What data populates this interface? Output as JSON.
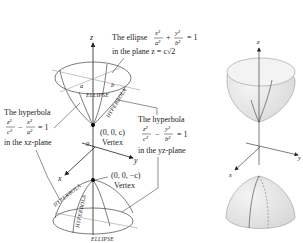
{
  "left_diagram": {
    "axes": {
      "z": "z",
      "y": "y",
      "x": "x",
      "origin": "0"
    },
    "top_ellipse_label": {
      "line1_prefix": "The ellipse",
      "frac1_num": "x²",
      "frac1_den": "a²",
      "plus": "+",
      "frac2_num": "y²",
      "frac2_den": "b²",
      "equals": "= 1",
      "line2": "in the plane z = c√2"
    },
    "semi_axes": {
      "a": "a",
      "b": "b"
    },
    "curve_labels": {
      "ellipse_top": "ELLIPSE",
      "hyperbola_top": "HYPERBOLA",
      "hyperbola_bottom_1": "HYPERBOLA",
      "hyperbola_bottom_2": "HYPERBOLA",
      "ellipse_bottom": "ELLIPSE"
    },
    "xz_hyperbola_label": {
      "line1": "The hyperbola",
      "frac1_num": "z²",
      "frac1_den": "c²",
      "minus": "−",
      "frac2_num": "x²",
      "frac2_den": "a²",
      "equals": "= 1",
      "line3": "in the xz-plane"
    },
    "yz_hyperbola_label": {
      "line1": "The hyperbola",
      "frac1_num": "z²",
      "frac1_den": "c²",
      "minus": "−",
      "frac2_num": "y²",
      "frac2_den": "b²",
      "equals": "= 1",
      "line3": "in the yz-plane"
    },
    "vertex_top": {
      "coords": "(0, 0, c)",
      "label": "Vertex"
    },
    "vertex_bottom": {
      "coords": "(0, 0, −c)",
      "label": "Vertex"
    }
  },
  "right_diagram": {
    "axes": {
      "z": "z",
      "y": "y",
      "x": "x"
    },
    "surface_color": "#e6e6e6"
  }
}
